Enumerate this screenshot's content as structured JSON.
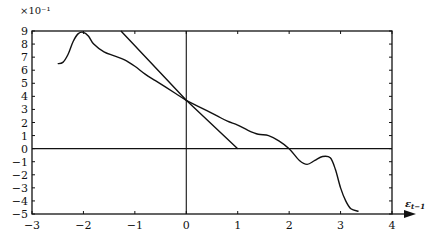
{
  "chart_data": {
    "type": "line",
    "title": "",
    "xlabel": "ε_{t-1}",
    "ylabel": "",
    "y_multiplier_label": "×10⁻¹",
    "xlim": [
      -3,
      4
    ],
    "ylim": [
      -5,
      9
    ],
    "x_ticks": [
      -3,
      -2,
      -1,
      0,
      1,
      2,
      3,
      4
    ],
    "y_ticks": [
      9,
      8,
      7,
      6,
      5,
      4,
      3,
      2,
      1,
      0,
      -1,
      -2,
      -3,
      -4,
      -5
    ],
    "grid": false,
    "reference_lines": [
      {
        "orientation": "vertical",
        "x": 0
      },
      {
        "orientation": "horizontal",
        "y": 0
      }
    ],
    "series": [
      {
        "name": "nonparametric estimate",
        "style": "smooth",
        "x": [
          -2.5,
          -2.4,
          -2.3,
          -2.2,
          -2.1,
          -2.0,
          -1.9,
          -1.8,
          -1.6,
          -1.4,
          -1.2,
          -1.0,
          -0.8,
          -0.6,
          -0.4,
          -0.2,
          0.0,
          0.2,
          0.4,
          0.6,
          0.8,
          1.0,
          1.2,
          1.4,
          1.6,
          1.8,
          2.0,
          2.2,
          2.35,
          2.5,
          2.65,
          2.8,
          2.9,
          3.0,
          3.1,
          3.2,
          3.35
        ],
        "y": [
          6.5,
          6.6,
          7.2,
          8.2,
          8.8,
          8.9,
          8.6,
          8.0,
          7.4,
          7.1,
          6.8,
          6.3,
          5.7,
          5.2,
          4.7,
          4.2,
          3.7,
          3.3,
          2.9,
          2.5,
          2.1,
          1.8,
          1.4,
          1.1,
          1.0,
          0.6,
          0.0,
          -0.9,
          -1.2,
          -0.9,
          -0.6,
          -0.7,
          -1.6,
          -3.0,
          -4.0,
          -4.6,
          -4.8
        ]
      },
      {
        "name": "linear reference",
        "style": "straight",
        "x": [
          -1.27,
          0.0,
          1.0
        ],
        "y": [
          9.0,
          3.7,
          0.0
        ]
      }
    ]
  }
}
